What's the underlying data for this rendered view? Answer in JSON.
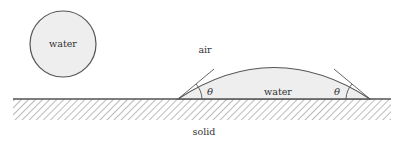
{
  "diagram": {
    "free_drop": {
      "label": "water"
    },
    "labels": {
      "air": "air",
      "droplet": "water",
      "solid": "solid",
      "angle_left": "θ",
      "angle_right": "θ"
    },
    "colors": {
      "water_fill": "#eeeeee",
      "outline": "#555555",
      "hatch": "#777777",
      "text": "#333333"
    }
  }
}
